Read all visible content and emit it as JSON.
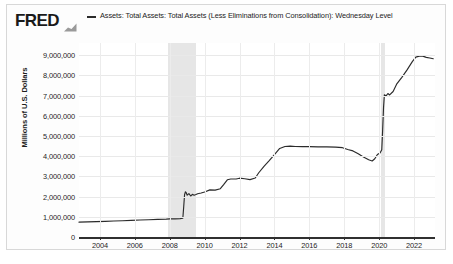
{
  "branding": {
    "logo_text": "FRED",
    "logo_mark_icon": "fred-chart-glyph-icon"
  },
  "legend": {
    "swatch_icon": "line-swatch-icon",
    "series_label": "Assets: Total Assets: Total Assets (Less Eliminations from Consolidation): Wednesday Level",
    "series_color": "#2b2b2b"
  },
  "axes": {
    "y_axis_title": "Millions of U.S. Dollars",
    "y_tick_labels": [
      "9,000,000",
      "8,000,000",
      "7,000,000",
      "6,000,000",
      "5,000,000",
      "4,000,000",
      "3,000,000",
      "2,000,000",
      "1,000,000",
      "0"
    ],
    "x_tick_labels": [
      "2004",
      "2006",
      "2008",
      "2010",
      "2012",
      "2014",
      "2016",
      "2018",
      "2020",
      "2022"
    ]
  },
  "recessions": [
    {
      "name": "recession-2007-2009",
      "start": 2007.92,
      "end": 2009.5
    },
    {
      "name": "recession-2020",
      "start": 2020.08,
      "end": 2020.33
    }
  ],
  "chart_data": {
    "type": "line",
    "title": "Assets: Total Assets: Total Assets (Less Eliminations from Consolidation): Wednesday Level",
    "xlabel": "",
    "ylabel": "Millions of U.S. Dollars",
    "xlim": [
      2002.8,
      2023.2
    ],
    "ylim": [
      0,
      9600000
    ],
    "grid": true,
    "legend_position": "top",
    "line_color": "#2b2b2b",
    "yticks": [
      0,
      1000000,
      2000000,
      3000000,
      4000000,
      5000000,
      6000000,
      7000000,
      8000000,
      9000000
    ],
    "xticks": [
      2004,
      2006,
      2008,
      2010,
      2012,
      2014,
      2016,
      2018,
      2020,
      2022
    ],
    "series": [
      {
        "name": "Assets: Total Assets: Total Assets (Less Eliminations from Consolidation): Wednesday Level",
        "x": [
          2002.8,
          2003.3,
          2003.8,
          2004.3,
          2004.8,
          2005.3,
          2005.8,
          2006.3,
          2006.8,
          2007.3,
          2007.8,
          2008.0,
          2008.3,
          2008.6,
          2008.75,
          2008.8,
          2008.85,
          2008.9,
          2008.95,
          2009.0,
          2009.1,
          2009.2,
          2009.3,
          2009.4,
          2009.5,
          2009.6,
          2009.8,
          2010.0,
          2010.3,
          2010.6,
          2010.9,
          2011.1,
          2011.3,
          2011.5,
          2011.8,
          2012.0,
          2012.3,
          2012.6,
          2012.9,
          2013.1,
          2013.4,
          2013.7,
          2014.0,
          2014.3,
          2014.6,
          2014.9,
          2015.2,
          2015.6,
          2016.0,
          2016.5,
          2017.0,
          2017.5,
          2017.9,
          2018.2,
          2018.5,
          2018.8,
          2019.1,
          2019.4,
          2019.6,
          2019.75,
          2019.9,
          2020.05,
          2020.15,
          2020.2,
          2020.25,
          2020.3,
          2020.4,
          2020.5,
          2020.6,
          2020.8,
          2021.0,
          2021.3,
          2021.6,
          2021.9,
          2022.1,
          2022.3,
          2022.5,
          2022.7,
          2022.9,
          2023.1
        ],
        "y": [
          735000,
          745000,
          760000,
          775000,
          790000,
          805000,
          820000,
          840000,
          855000,
          870000,
          885000,
          895000,
          900000,
          910000,
          930000,
          1500000,
          2100000,
          2240000,
          2180000,
          2070000,
          2150000,
          2030000,
          2110000,
          2070000,
          2100000,
          2140000,
          2180000,
          2230000,
          2330000,
          2320000,
          2390000,
          2600000,
          2830000,
          2870000,
          2870000,
          2910000,
          2880000,
          2840000,
          2920000,
          3180000,
          3500000,
          3780000,
          4080000,
          4380000,
          4480000,
          4500000,
          4480000,
          4470000,
          4470000,
          4460000,
          4460000,
          4450000,
          4420000,
          4330000,
          4260000,
          4120000,
          3960000,
          3820000,
          3760000,
          3870000,
          4080000,
          4160000,
          4320000,
          5300000,
          6400000,
          7040000,
          6980000,
          7100000,
          7030000,
          7200000,
          7560000,
          7900000,
          8270000,
          8680000,
          8900000,
          8950000,
          8950000,
          8890000,
          8860000,
          8820000
        ]
      }
    ]
  }
}
